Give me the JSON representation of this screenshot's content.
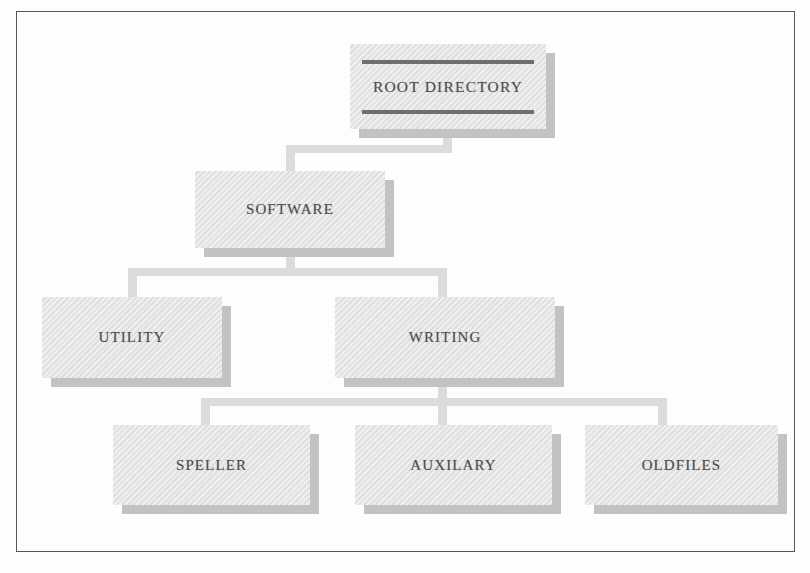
{
  "diagram": {
    "type": "hierarchy-tree",
    "colors": {
      "page_background": "#fefefe",
      "frame_border": "#575757",
      "box_face": "#e4e4e4",
      "box_shadow": "#c3c3c3",
      "connector": "#dcdcdc",
      "label_text": "#4d4d4d",
      "rule_line": "#6f6f6f"
    },
    "nodes": [
      {
        "id": "root",
        "label": "ROOT DIRECTORY",
        "level": 0,
        "x": 350,
        "y": 44,
        "w": 196,
        "h": 85,
        "rules": true,
        "parent": null
      },
      {
        "id": "software",
        "label": "SOFTWARE",
        "level": 1,
        "x": 195,
        "y": 171,
        "w": 190,
        "h": 77,
        "rules": false,
        "parent": "root"
      },
      {
        "id": "utility",
        "label": "UTILITY",
        "level": 2,
        "x": 42,
        "y": 297,
        "w": 180,
        "h": 81,
        "rules": false,
        "parent": "software"
      },
      {
        "id": "writing",
        "label": "WRITING",
        "level": 2,
        "x": 335,
        "y": 297,
        "w": 220,
        "h": 81,
        "rules": false,
        "parent": "software"
      },
      {
        "id": "speller",
        "label": "SPELLER",
        "level": 3,
        "x": 113,
        "y": 425,
        "w": 197,
        "h": 80,
        "rules": false,
        "parent": "writing"
      },
      {
        "id": "auxilary",
        "label": "AUXILARY",
        "level": 3,
        "x": 355,
        "y": 425,
        "w": 197,
        "h": 80,
        "rules": false,
        "parent": "writing"
      },
      {
        "id": "oldfiles",
        "label": "OLDFILES",
        "level": 3,
        "x": 585,
        "y": 425,
        "w": 193,
        "h": 80,
        "rules": false,
        "parent": "writing"
      }
    ],
    "connectors": [
      {
        "id": "root-to-software",
        "from": "root",
        "to": [
          "software"
        ]
      },
      {
        "id": "software-to-level2",
        "from": "software",
        "to": [
          "utility",
          "writing"
        ]
      },
      {
        "id": "writing-to-level3",
        "from": "writing",
        "to": [
          "speller",
          "auxilary",
          "oldfiles"
        ]
      }
    ]
  }
}
